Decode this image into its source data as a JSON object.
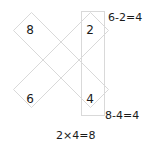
{
  "figure": {
    "line_color": "#d9d9d9",
    "text_color": "#1a1a1a",
    "background": "#ffffff"
  },
  "cells": {
    "top_left": "8",
    "top_right": "2",
    "bottom_left": "6",
    "bottom_right": "4"
  },
  "equations": {
    "top_right": "6-2=4",
    "bottom_right": "8-4=4",
    "bottom_center": "2×4=8"
  },
  "shapes": {
    "band_down": "diagonal-band-top-left-to-bottom-right",
    "band_up": "diagonal-band-bottom-left-to-top-right",
    "vertical": "vertical-rectangle-right"
  }
}
